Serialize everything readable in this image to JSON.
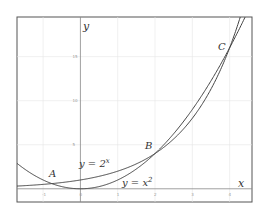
{
  "chart_data": {
    "type": "line",
    "title": "",
    "xlabel": "x",
    "ylabel": "y",
    "xlim": [
      -1.7,
      4.6
    ],
    "ylim": [
      -1.5,
      19.5
    ],
    "grid": true,
    "x_ticks": [
      -1,
      0,
      1,
      2,
      3,
      4
    ],
    "y_ticks": [
      5,
      10,
      15
    ],
    "series": [
      {
        "name": "y = 2^x",
        "label": "y = 2ˣ",
        "function": "2^x"
      },
      {
        "name": "y = x^2",
        "label": "y = x²",
        "function": "x^2"
      }
    ],
    "annotations": [
      {
        "text": "A",
        "x": -0.77,
        "y": 0.59
      },
      {
        "text": "B",
        "x": 2,
        "y": 4
      },
      {
        "text": "C",
        "x": 4,
        "y": 16
      }
    ]
  },
  "labels": {
    "x_axis": "x",
    "y_axis": "y",
    "curve_exp": "y = 2",
    "curve_exp_sup": "x",
    "curve_sq": "y = x",
    "curve_sq_sup": "2",
    "point_a": "A",
    "point_b": "B",
    "point_c": "C",
    "tick_x": [
      "-1",
      "0",
      "1",
      "2",
      "3",
      "4"
    ],
    "tick_y": [
      "5",
      "10",
      "15"
    ]
  }
}
